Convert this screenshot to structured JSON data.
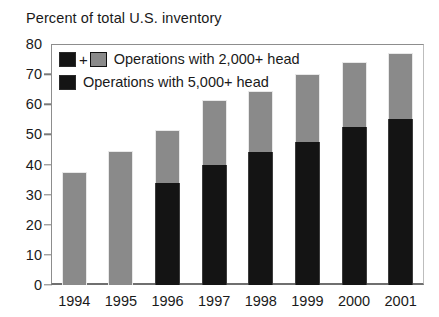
{
  "chart_data": {
    "type": "bar",
    "subtype": "stacked-bar",
    "title": "Percent of total U.S. inventory",
    "xlabel": "",
    "ylabel": "",
    "ylim": [
      0,
      80
    ],
    "ytick_step": 10,
    "yticks": [
      0,
      10,
      20,
      30,
      40,
      50,
      60,
      70,
      80
    ],
    "ytick_labels": [
      "0",
      "10",
      "20",
      "30",
      "40",
      "50",
      "60",
      "70",
      "80"
    ],
    "grid": false,
    "legend_position": "top-left-inside",
    "categories": [
      "1994",
      "1995",
      "1996",
      "1997",
      "1998",
      "1999",
      "2000",
      "2001"
    ],
    "series": [
      {
        "name": "Operations with 5,000+ head",
        "color": "#141414",
        "values": [
          0,
          0,
          34,
          40,
          44,
          47.5,
          52.5,
          55
        ]
      },
      {
        "name": "Operations with 2,000+ head",
        "color": "#8a8a8a",
        "note": "upper gray segment; legend marker shows black + gray, totals are cumulative",
        "values": [
          37.5,
          44.5,
          17.5,
          21.5,
          20.5,
          22.5,
          21.5,
          22
        ]
      }
    ],
    "totals": [
      37.5,
      44.5,
      51.5,
      61.5,
      64.5,
      70,
      74,
      77
    ]
  },
  "legend": {
    "items": [
      {
        "label": "Operations with 2,000+ head",
        "marker": "black-plus-gray",
        "plus_symbol": "+"
      },
      {
        "label": "Operations with 5,000+ head",
        "marker": "black"
      }
    ]
  },
  "colors": {
    "segment_upper": "#8a8a8a",
    "segment_lower": "#141414",
    "axis": "#7a7a7a",
    "text": "#1a1a1a",
    "background": "#ffffff"
  }
}
